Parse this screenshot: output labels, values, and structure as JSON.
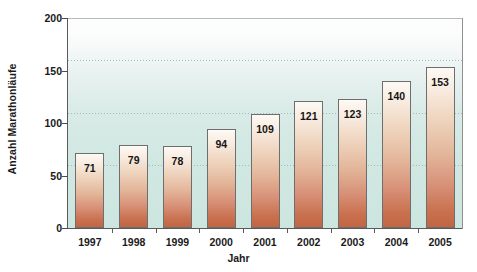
{
  "chart_data": {
    "type": "bar",
    "title": "",
    "xlabel": "Jahr",
    "ylabel": "Anzahl Marathonläufe",
    "categories": [
      "1997",
      "1998",
      "1999",
      "2000",
      "2001",
      "2002",
      "2003",
      "2004",
      "2005"
    ],
    "values": [
      71,
      79,
      78,
      94,
      109,
      121,
      123,
      140,
      153
    ],
    "value_labels": [
      "71",
      "79",
      "78",
      "94",
      "109",
      "121",
      "123",
      "140",
      "153"
    ],
    "ylim": [
      0,
      200
    ],
    "yticks": [
      0,
      50,
      100,
      150,
      200
    ],
    "ytick_labels": [
      "0",
      "50",
      "100",
      "150",
      "200"
    ],
    "gridlines": [
      60,
      110,
      160
    ],
    "grid": true,
    "legend": null,
    "colors": {
      "bar_top": "#fdf9f4",
      "bar_bottom": "#c26542",
      "bar_border": "#6e6e6e",
      "plot_background_top": "#fdfdfd",
      "plot_background_bottom": "#cde5df",
      "gridline": "#9ab3b0",
      "axis": "#5a5a5a",
      "text": "#1a1a1a"
    }
  }
}
